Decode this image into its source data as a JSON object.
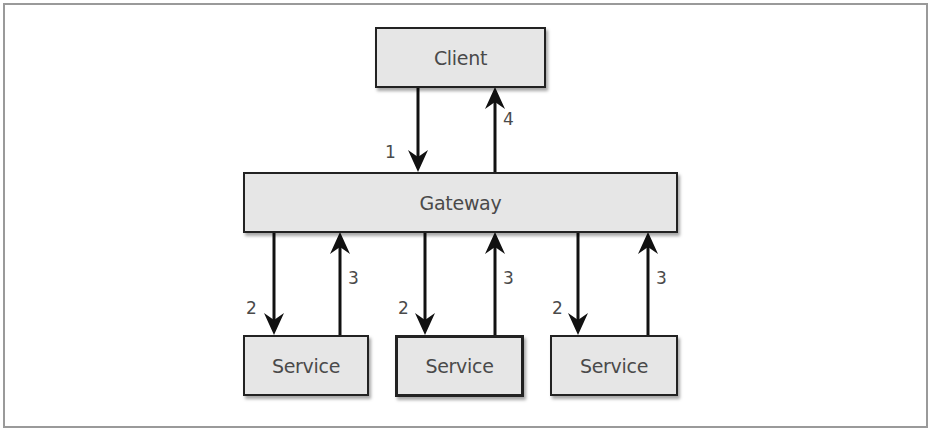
{
  "diagram": {
    "nodes": {
      "client": "Client",
      "gateway": "Gateway",
      "services": [
        "Service",
        "Service",
        "Service"
      ]
    },
    "edges": [
      {
        "from": "client",
        "to": "gateway",
        "label": "1"
      },
      {
        "from": "gateway",
        "to": "service-1",
        "label": "2"
      },
      {
        "from": "service-1",
        "to": "gateway",
        "label": "3"
      },
      {
        "from": "gateway",
        "to": "service-2",
        "label": "2"
      },
      {
        "from": "service-2",
        "to": "gateway",
        "label": "3"
      },
      {
        "from": "gateway",
        "to": "service-3",
        "label": "2"
      },
      {
        "from": "service-3",
        "to": "gateway",
        "label": "3"
      },
      {
        "from": "gateway",
        "to": "client",
        "label": "4"
      }
    ],
    "labels": {
      "step1": "1",
      "step2": "2",
      "step3": "3",
      "step4": "4"
    },
    "colors": {
      "box_fill": "#e6e6e6",
      "stroke": "#222222",
      "text": "#4a4a4a",
      "frame": "#9a9a9a"
    }
  }
}
